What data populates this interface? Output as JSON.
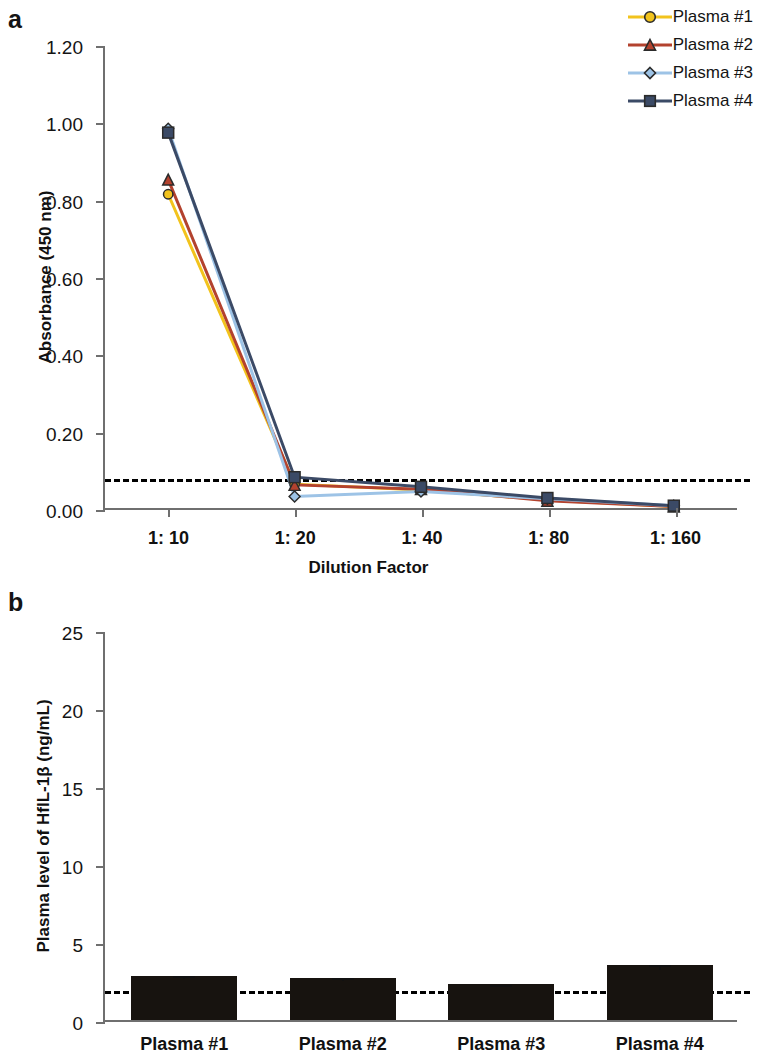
{
  "figure": {
    "panels": [
      {
        "label": "a",
        "xlabel": "Dilution Factor",
        "ylabel": "Absorbance (450 nm)"
      },
      {
        "label": "b",
        "xlabel": "",
        "ylabel": "Plasma level of HfIL-1β (ng/mL)"
      }
    ]
  },
  "legend": {
    "items": [
      {
        "label": "Plasma #1",
        "color": "#f2c31d",
        "marker": "circle"
      },
      {
        "label": "Plasma #2",
        "color": "#b3422e",
        "marker": "triangle"
      },
      {
        "label": "Plasma #3",
        "color": "#9dc3e6",
        "marker": "diamond"
      },
      {
        "label": "Plasma #4",
        "color": "#3b4a66",
        "marker": "square"
      }
    ]
  },
  "chart_data": [
    {
      "type": "line",
      "panel": "a",
      "title": "",
      "xlabel": "Dilution Factor",
      "ylabel": "Absorbance (450 nm)",
      "categories": [
        "1: 10",
        "1: 20",
        "1: 40",
        "1: 80",
        "1: 160"
      ],
      "yticks": [
        "0.00",
        "0.20",
        "0.40",
        "0.60",
        "0.80",
        "1.00",
        "1.20"
      ],
      "ytick_values": [
        0.0,
        0.2,
        0.4,
        0.6,
        0.8,
        1.0,
        1.2
      ],
      "ylim": [
        0.0,
        1.2
      ],
      "grid": false,
      "legend_position": "top-right",
      "threshold": {
        "value": 0.08,
        "style": "dashed",
        "color": "#000000"
      },
      "series": [
        {
          "name": "Plasma #1",
          "color": "#f2c31d",
          "marker": "circle",
          "values": [
            0.815,
            0.062,
            0.047,
            0.021,
            0.004
          ]
        },
        {
          "name": "Plasma #2",
          "color": "#b3422e",
          "marker": "triangle",
          "values": [
            0.853,
            0.06,
            0.049,
            0.019,
            0.004
          ]
        },
        {
          "name": "Plasma #3",
          "color": "#9dc3e6",
          "marker": "diamond",
          "values": [
            0.985,
            0.03,
            0.043,
            0.024,
            0.006
          ]
        },
        {
          "name": "Plasma #4",
          "color": "#3b4a66",
          "marker": "square",
          "values": [
            0.975,
            0.08,
            0.055,
            0.026,
            0.006
          ]
        }
      ]
    },
    {
      "type": "bar",
      "panel": "b",
      "title": "",
      "xlabel": "",
      "ylabel": "Plasma level of HfIL-1β (ng/mL)",
      "categories": [
        "Plasma #1",
        "Plasma #2",
        "Plasma #3",
        "Plasma #4"
      ],
      "values": [
        2.85,
        2.72,
        2.32,
        3.5
      ],
      "errors": [
        0.12,
        0.1,
        0.08,
        0.18
      ],
      "yticks": [
        "0",
        "5",
        "10",
        "15",
        "20",
        "25"
      ],
      "ytick_values": [
        0,
        5,
        10,
        15,
        20,
        25
      ],
      "ylim": [
        0,
        25
      ],
      "grid": false,
      "bar_color": "#17130f",
      "threshold": {
        "value": 2.0,
        "style": "dashed",
        "color": "#000000"
      }
    }
  ]
}
